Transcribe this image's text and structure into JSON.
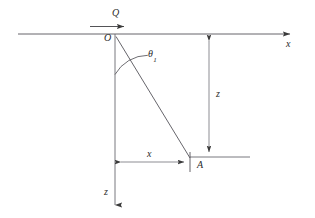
{
  "figure": {
    "type": "geotechnical-point-load-diagram",
    "stroke_color": "#4a4a4a",
    "text_color": "#2b2b2b",
    "background_color": "#ffffff"
  },
  "labels": {
    "load": "Q",
    "origin": "O",
    "angle": "θ",
    "angle_subscript": "1",
    "x_axis": "x",
    "z_axis": "z",
    "depth_dimension": "z",
    "horizontal_dimension": "x",
    "point_a": "A"
  },
  "geometry": {
    "ground_line": {
      "x1": 18,
      "y1": 34,
      "x2": 297,
      "y2": 34
    },
    "origin_point": {
      "x": 115,
      "y": 36
    },
    "point_a": {
      "x": 190,
      "y": 158
    },
    "vertical_axis": {
      "x1": 115,
      "y1": 34,
      "x2": 115,
      "y2": 211
    },
    "diagonal_oa": {
      "x1": 116,
      "y1": 36,
      "x2": 190,
      "y2": 158
    },
    "load_arrow": {
      "x1": 90,
      "y1": 26,
      "x2": 128,
      "y2": 26
    },
    "depth_dimension_line": {
      "x": 209,
      "y1": 36,
      "y2": 157
    },
    "horizontal_dimension_line": {
      "y": 162,
      "x1": 116,
      "x2": 189
    },
    "extension_line_right": {
      "x1": 190,
      "y1": 157,
      "x2": 250,
      "y2": 157
    },
    "extension_line_a_vertical": {
      "x": 190,
      "y1": 154,
      "y2": 172
    },
    "angle_arc_radius": 38
  }
}
